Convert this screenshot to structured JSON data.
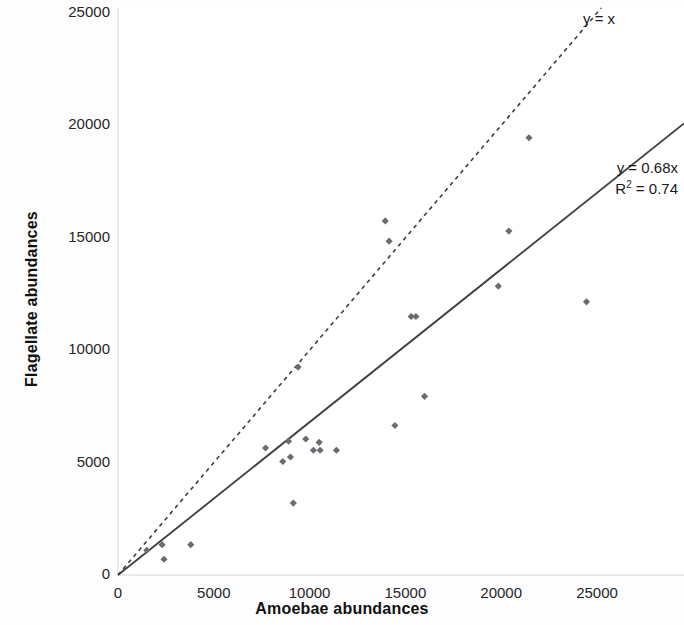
{
  "chart_data": {
    "type": "scatter",
    "title": "",
    "xlabel": "Amoebae abundances",
    "ylabel": "Flagellate abundances",
    "xlim": [
      0,
      26000
    ],
    "ylim": [
      0,
      25600
    ],
    "xticks": [
      "0",
      "5000",
      "10000",
      "15000",
      "20000",
      "25000"
    ],
    "xtick_values": [
      0,
      5000,
      10000,
      15000,
      20000,
      25000
    ],
    "yticks": [
      "0",
      "5000",
      "10000",
      "15000",
      "20000",
      "25000"
    ],
    "ytick_values": [
      0,
      5000,
      10000,
      15000,
      20000,
      25000
    ],
    "grid": false,
    "legend": "none",
    "marker": "diamond",
    "marker_color": "#6b6b73",
    "points": [
      {
        "x": 1500,
        "y": 1100
      },
      {
        "x": 2300,
        "y": 1350
      },
      {
        "x": 2400,
        "y": 700
      },
      {
        "x": 3800,
        "y": 1350
      },
      {
        "x": 7700,
        "y": 5650
      },
      {
        "x": 8600,
        "y": 5050
      },
      {
        "x": 8900,
        "y": 5950
      },
      {
        "x": 9000,
        "y": 5250
      },
      {
        "x": 9150,
        "y": 3200
      },
      {
        "x": 9400,
        "y": 9250
      },
      {
        "x": 9800,
        "y": 6050
      },
      {
        "x": 10200,
        "y": 5550
      },
      {
        "x": 10500,
        "y": 5900
      },
      {
        "x": 10550,
        "y": 5550
      },
      {
        "x": 11400,
        "y": 5550
      },
      {
        "x": 13950,
        "y": 15750
      },
      {
        "x": 14150,
        "y": 14850
      },
      {
        "x": 14450,
        "y": 6650
      },
      {
        "x": 15300,
        "y": 11500
      },
      {
        "x": 15550,
        "y": 11500
      },
      {
        "x": 16000,
        "y": 7950
      },
      {
        "x": 19850,
        "y": 12850
      },
      {
        "x": 20400,
        "y": 15300
      },
      {
        "x": 24450,
        "y": 12150
      },
      {
        "x": 21450,
        "y": 19450
      }
    ],
    "series": [
      {
        "name": "y = x",
        "type": "line",
        "style": "dashed",
        "slope": 1,
        "intercept": 0,
        "color": "#3d3d3d",
        "label": "y = x"
      },
      {
        "name": "regression",
        "type": "line",
        "style": "solid",
        "slope": 0.68,
        "intercept": 0,
        "color": "#3d3d3d",
        "label": "y = 0.68x",
        "r_squared_label": "R² = 0.74",
        "r_squared": 0.74
      }
    ],
    "annotations": [
      {
        "text": "y = x",
        "x": 21800,
        "y": 25000
      },
      {
        "text": "y = 0.68x",
        "x": 24500,
        "y": 19300
      },
      {
        "text": "R² = 0.74",
        "x": 24500,
        "y": 18150
      }
    ]
  },
  "annotations": {
    "identity_line_label": "y = x",
    "equation_label": "y = 0.68x",
    "r_squared_label_prefix": "R",
    "r_squared_label_sup": "2",
    "r_squared_label_suffix": " = 0.74"
  }
}
